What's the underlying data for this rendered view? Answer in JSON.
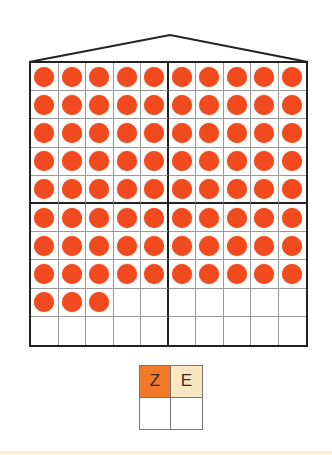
{
  "figure": {
    "grid": {
      "rows": 10,
      "cols": 10,
      "filled_per_row": [
        10,
        10,
        10,
        10,
        10,
        10,
        10,
        10,
        3,
        0
      ],
      "blocks": {
        "top_left": [
          5,
          5,
          5,
          5,
          5
        ],
        "top_right": [
          5,
          5,
          5,
          5,
          5
        ],
        "bottom_left": [
          5,
          5,
          5,
          3,
          0
        ],
        "bottom_right": [
          5,
          5,
          5,
          0,
          0
        ]
      },
      "total_dots": 83,
      "dot_color": "#f04a1e",
      "line_color": "#222222"
    },
    "place_value_table": {
      "headers": [
        {
          "label": "Z",
          "color": "#f07a2a"
        },
        {
          "label": "E",
          "color": "#f9e7c4"
        }
      ],
      "values": [
        "",
        ""
      ]
    }
  }
}
